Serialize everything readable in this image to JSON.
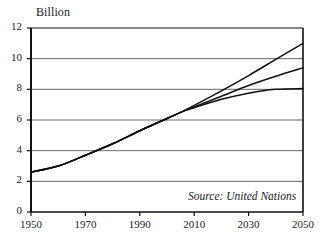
{
  "chart_data": {
    "type": "line",
    "title": "",
    "subtitle": "",
    "unit_label": "Billion",
    "xlabel": "",
    "ylabel": "",
    "source_note": "Source: United Nations",
    "grid": true,
    "legend_position": "none",
    "xlim": [
      1950,
      2050
    ],
    "ylim": [
      0,
      12
    ],
    "xticks": [
      1950,
      1970,
      1990,
      2010,
      2030,
      2050
    ],
    "xtick_labels": [
      "1950",
      "1970",
      "1990",
      "2010",
      "2030",
      "2050"
    ],
    "yticks": [
      0,
      2,
      4,
      6,
      8,
      10,
      12
    ],
    "ytick_labels": [
      "0",
      "2",
      "4",
      "6",
      "8",
      "10",
      "12"
    ],
    "series": [
      {
        "name": "high-variant",
        "x": [
          1950,
          1960,
          1970,
          1980,
          1990,
          2000,
          2005,
          2010,
          2020,
          2030,
          2040,
          2050
        ],
        "values": [
          2.6,
          3.0,
          3.7,
          4.45,
          5.3,
          6.1,
          6.5,
          6.95,
          7.9,
          8.9,
          9.95,
          11.0
        ]
      },
      {
        "name": "medium-variant",
        "x": [
          1950,
          1960,
          1970,
          1980,
          1990,
          2000,
          2005,
          2010,
          2020,
          2030,
          2040,
          2050
        ],
        "values": [
          2.6,
          3.0,
          3.7,
          4.45,
          5.3,
          6.1,
          6.5,
          6.85,
          7.55,
          8.25,
          8.85,
          9.4
        ]
      },
      {
        "name": "low-variant",
        "x": [
          1950,
          1960,
          1970,
          1980,
          1990,
          2000,
          2005,
          2010,
          2020,
          2030,
          2040,
          2050
        ],
        "values": [
          2.6,
          3.0,
          3.7,
          4.45,
          5.3,
          6.1,
          6.5,
          6.8,
          7.35,
          7.75,
          8.0,
          8.05
        ]
      }
    ],
    "colors": {
      "line": "#111111",
      "grid": "#666666",
      "axis": "#111111",
      "background": "#ffffff"
    }
  }
}
